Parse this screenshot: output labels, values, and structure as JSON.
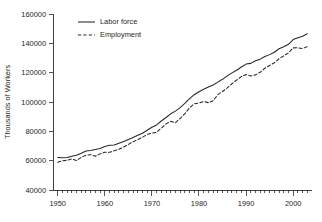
{
  "chart_data": {
    "type": "line",
    "title": "",
    "subtitle": "",
    "xlabel": "",
    "ylabel": "Thousands of Workers",
    "xlim": [
      1949,
      2004
    ],
    "ylim": [
      40000,
      160000
    ],
    "grid": false,
    "legend_position": "top-left",
    "y_ticks": [
      40000,
      60000,
      80000,
      100000,
      120000,
      140000,
      160000
    ],
    "y_tick_labels": [
      "40000",
      "60000",
      "80000",
      "100000",
      "120000",
      "140000",
      "160000"
    ],
    "x_ticks": [
      1950,
      1960,
      1970,
      1980,
      1990,
      2000
    ],
    "x_tick_labels": [
      "1950",
      "1960",
      "1970",
      "1980",
      "1990",
      "2000"
    ],
    "x_minor_tick_step": 1,
    "x": [
      1950,
      1951,
      1952,
      1953,
      1954,
      1955,
      1956,
      1957,
      1958,
      1959,
      1960,
      1961,
      1962,
      1963,
      1964,
      1965,
      1966,
      1967,
      1968,
      1969,
      1970,
      1971,
      1972,
      1973,
      1974,
      1975,
      1976,
      1977,
      1978,
      1979,
      1980,
      1981,
      1982,
      1983,
      1984,
      1985,
      1986,
      1987,
      1988,
      1989,
      1990,
      1991,
      1992,
      1993,
      1994,
      1995,
      1996,
      1997,
      1998,
      1999,
      2000,
      2001,
      2002,
      2003
    ],
    "series": [
      {
        "name": "Labor force",
        "style": "solid",
        "color": "#262626",
        "values": [
          62208,
          62017,
          62138,
          63015,
          63643,
          65023,
          66552,
          66929,
          67639,
          68369,
          69628,
          70459,
          70614,
          71833,
          73091,
          74455,
          75770,
          77347,
          78737,
          80734,
          82771,
          84382,
          87034,
          89429,
          91949,
          93775,
          96158,
          99009,
          102251,
          104962,
          106940,
          108670,
          110204,
          111550,
          113544,
          115461,
          117834,
          119865,
          121669,
          123869,
          125840,
          126346,
          128105,
          129200,
          131056,
          132304,
          133943,
          136297,
          137673,
          139368,
          142583,
          143734,
          144863,
          146510
        ]
      },
      {
        "name": "Employment",
        "style": "dashed",
        "color": "#262626",
        "values": [
          58918,
          59961,
          60250,
          61179,
          60109,
          62170,
          63799,
          64071,
          63036,
          64630,
          65778,
          65746,
          66702,
          67762,
          69305,
          71088,
          72895,
          74372,
          75920,
          77902,
          78678,
          79367,
          82153,
          85064,
          86794,
          85846,
          88752,
          92017,
          96048,
          98824,
          99303,
          100397,
          99526,
          100834,
          105005,
          107150,
          109597,
          112440,
          114968,
          117342,
          118793,
          117718,
          118492,
          120259,
          123060,
          124900,
          126708,
          129558,
          131463,
          133488,
          136891,
          136933,
          136485,
          137736
        ]
      }
    ],
    "annotations": []
  },
  "legend": {
    "items": [
      {
        "label": "Labor force",
        "style": "solid"
      },
      {
        "label": "Employment",
        "style": "dashed"
      }
    ]
  }
}
